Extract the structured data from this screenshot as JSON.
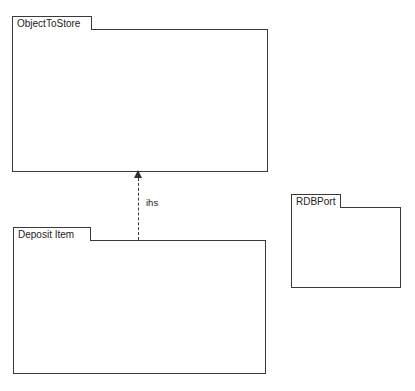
{
  "diagram": {
    "background_color": "#ffffff",
    "line_color": "#3a3a3a",
    "text_color": "#232323"
  },
  "packages": [
    {
      "id": "object-to-store",
      "name": "ObjectToStore",
      "classes": [
        {
          "name": "Object"
        },
        {
          "name": "ObjectState"
        },
        {
          "name": "PersistentObjectAdministrator"
        },
        {
          "name": "PersistentState"
        }
      ]
    },
    {
      "id": "deposit-item",
      "name": "Deposit Item",
      "classes": [
        {
          "name": "Item"
        },
        {
          "name": "ItemState"
        },
        {
          "name": "PersistentItemAdministrator"
        },
        {
          "name": "PersistentItemState"
        }
      ]
    },
    {
      "id": "rdb-port",
      "name": "RDBPort",
      "classes": [
        {
          "name": "Port"
        }
      ]
    }
  ],
  "relations": [
    {
      "id": "ihs-dependency",
      "label": "ihs",
      "from": "deposit-item",
      "to": "object-to-store",
      "style": "dashed",
      "arrowhead": "solid-triangle"
    }
  ]
}
